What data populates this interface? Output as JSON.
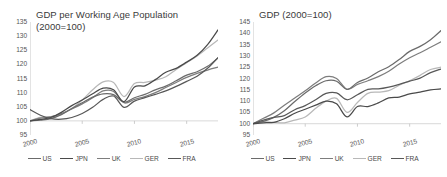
{
  "figure": {
    "background": "#ffffff",
    "series_colors": {
      "US": "#6b6b6b",
      "JPN": "#4a4a4a",
      "UK": "#7d7d7d",
      "GER": "#b8b8b8",
      "FRA": "#585858"
    }
  },
  "legend": {
    "position": "bottom",
    "entries": [
      {
        "label": "US",
        "color": "#6b6b6b"
      },
      {
        "label": "JPN",
        "color": "#4a4a4a"
      },
      {
        "label": "UK",
        "color": "#7d7d7d"
      },
      {
        "label": "GER",
        "color": "#b8b8b8"
      },
      {
        "label": "FRA",
        "color": "#585858"
      }
    ]
  },
  "left_panel": {
    "title": "GDP per Working Age Population\n(2000=100)",
    "yticks": [
      "135",
      "130",
      "125",
      "120",
      "115",
      "110",
      "105",
      "100",
      "95"
    ],
    "xticks": [
      "2000",
      "2005",
      "2010",
      "2015"
    ]
  },
  "right_panel": {
    "title": "GDP (2000=100)",
    "yticks": [
      "145",
      "140",
      "135",
      "130",
      "125",
      "120",
      "115",
      "110",
      "105",
      "100",
      "95"
    ],
    "xticks": [
      "2000",
      "2005",
      "2010",
      "2015"
    ]
  },
  "chart_data": [
    {
      "type": "line",
      "title": "GDP per Working Age Population (2000=100)",
      "xlabel": "",
      "ylabel": "",
      "xlim": [
        2000,
        2018
      ],
      "ylim": [
        95,
        135
      ],
      "ytick_values": [
        95,
        100,
        105,
        110,
        115,
        120,
        125,
        130,
        135
      ],
      "xtick_values": [
        2000,
        2005,
        2010,
        2015
      ],
      "grid": false,
      "baseline": 100,
      "x": [
        2000,
        2001,
        2002,
        2003,
        2004,
        2005,
        2006,
        2007,
        2008,
        2009,
        2010,
        2011,
        2012,
        2013,
        2014,
        2015,
        2016,
        2017,
        2018
      ],
      "series": [
        {
          "name": "US",
          "color": "#6b6b6b",
          "values": [
            100,
            100.3,
            100.8,
            102.2,
            104.4,
            106.4,
            108.4,
            109.6,
            109.3,
            106.6,
            108.2,
            109.4,
            111.0,
            112.3,
            114.2,
            116.2,
            117.4,
            119.3,
            122.3
          ]
        },
        {
          "name": "JPN",
          "color": "#4a4a4a",
          "values": [
            100,
            100.5,
            101.2,
            103.0,
            105.4,
            107.4,
            109.6,
            111.6,
            111.0,
            106.8,
            112.0,
            112.4,
            114.6,
            117.2,
            118.6,
            120.8,
            123.2,
            127.0,
            132.2
          ]
        },
        {
          "name": "UK",
          "color": "#7d7d7d",
          "values": [
            100,
            101.0,
            101.4,
            102.6,
            104.2,
            106.0,
            108.2,
            110.6,
            110.4,
            106.4,
            107.6,
            108.6,
            110.0,
            111.8,
            113.6,
            115.4,
            116.8,
            118.0,
            119.0
          ]
        },
        {
          "name": "GER",
          "color": "#b8b8b8",
          "values": [
            100,
            101.2,
            101.5,
            102.4,
            104.4,
            107.4,
            111.0,
            113.8,
            113.6,
            108.6,
            113.2,
            113.6,
            114.4,
            115.6,
            118.2,
            120.6,
            123.0,
            125.8,
            128.6
          ]
        },
        {
          "name": "FRA",
          "color": "#585858",
          "values": [
            104,
            102.0,
            100.8,
            100.6,
            101.2,
            102.6,
            104.8,
            107.6,
            108.8,
            104.8,
            107.0,
            108.2,
            109.4,
            110.6,
            112.2,
            114.0,
            115.8,
            118.6,
            122.4
          ]
        }
      ]
    },
    {
      "type": "line",
      "title": "GDP (2000=100)",
      "xlabel": "",
      "ylabel": "",
      "xlim": [
        2000,
        2018
      ],
      "ylim": [
        95,
        145
      ],
      "ytick_values": [
        95,
        100,
        105,
        110,
        115,
        120,
        125,
        130,
        135,
        140,
        145
      ],
      "xtick_values": [
        2000,
        2005,
        2010,
        2015
      ],
      "grid": false,
      "baseline": 100,
      "x": [
        2000,
        2001,
        2002,
        2003,
        2004,
        2005,
        2006,
        2007,
        2008,
        2009,
        2010,
        2011,
        2012,
        2013,
        2014,
        2015,
        2016,
        2017,
        2018
      ],
      "series": [
        {
          "name": "US",
          "color": "#6b6b6b",
          "values": [
            100,
            101.0,
            102.8,
            105.7,
            109.8,
            113.6,
            116.8,
            119.0,
            118.8,
            115.2,
            118.2,
            120.2,
            123.0,
            125.2,
            128.4,
            132.0,
            134.2,
            137.2,
            141.2
          ]
        },
        {
          "name": "JPN",
          "color": "#4a4a4a",
          "values": [
            100,
            100.4,
            100.6,
            102.2,
            104.6,
            106.4,
            108.2,
            110.0,
            108.8,
            103.0,
            107.6,
            107.6,
            109.2,
            111.4,
            111.8,
            113.2,
            114.0,
            115.0,
            115.4
          ]
        },
        {
          "name": "UK",
          "color": "#7d7d7d",
          "values": [
            100,
            102.4,
            104.8,
            108.2,
            111.4,
            114.6,
            118.0,
            120.8,
            120.0,
            115.2,
            117.4,
            119.0,
            120.8,
            123.2,
            126.4,
            129.2,
            131.4,
            133.8,
            136.2
          ]
        },
        {
          "name": "GER",
          "color": "#b8b8b8",
          "values": [
            100,
            100.8,
            100.6,
            100.4,
            101.6,
            103.0,
            106.8,
            110.0,
            111.2,
            105.0,
            109.4,
            113.4,
            114.0,
            114.6,
            117.0,
            119.0,
            121.4,
            124.0,
            125.0
          ]
        },
        {
          "name": "FRA",
          "color": "#585858",
          "values": [
            100,
            101.6,
            102.8,
            103.6,
            106.2,
            108.0,
            110.6,
            113.4,
            113.6,
            110.6,
            112.8,
            115.2,
            115.4,
            116.2,
            117.4,
            118.8,
            120.2,
            122.6,
            124.2
          ]
        }
      ]
    }
  ]
}
